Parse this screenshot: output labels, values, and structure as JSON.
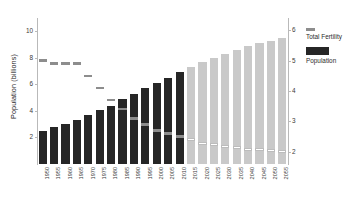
{
  "chart_data": {
    "type": "bar",
    "title": "",
    "xlabel": "",
    "ylabel": "Population (billions)",
    "ylabel_right": "",
    "ylim": [
      0,
      11
    ],
    "ylim_right": [
      1.6,
      6.4
    ],
    "grid": false,
    "legend_position": "right",
    "categories": [
      "1950",
      "1955",
      "1960",
      "1965",
      "1970",
      "1975",
      "1980",
      "1985",
      "1990",
      "1995",
      "2000",
      "2005",
      "2010",
      "2015",
      "2020",
      "2025",
      "2030",
      "2035",
      "2040",
      "2045",
      "2050",
      "2055"
    ],
    "series": [
      {
        "name": "Population",
        "axis": "left",
        "unit": "billions",
        "values": [
          2.5,
          2.8,
          3.0,
          3.3,
          3.7,
          4.1,
          4.4,
          4.9,
          5.3,
          5.7,
          6.1,
          6.5,
          6.9,
          7.3,
          7.7,
          8.0,
          8.3,
          8.6,
          8.9,
          9.1,
          9.3,
          9.5
        ],
        "historical_count": 13,
        "projected_count": 9,
        "color_historical": "#262626",
        "color_projected": "#c9c9c9"
      },
      {
        "name": "Total Fertility",
        "axis": "right",
        "unit": "children per woman",
        "values": [
          5.0,
          4.9,
          4.9,
          4.9,
          4.5,
          4.1,
          3.7,
          3.4,
          3.1,
          2.9,
          2.7,
          2.6,
          2.5,
          2.4,
          2.3,
          2.25,
          2.2,
          2.15,
          2.1,
          2.08,
          2.05,
          2.02
        ],
        "color": "#8d8d8d"
      }
    ],
    "yticks_left": [
      "10",
      "8",
      "6",
      "4",
      "2"
    ],
    "yticks_left_values": [
      10,
      8,
      6,
      4,
      2
    ],
    "yticks_right": [
      "6",
      "5",
      "4",
      "3",
      "2"
    ],
    "yticks_right_values": [
      6,
      5,
      4,
      3,
      2
    ]
  },
  "legend": {
    "fertility_label": "Total Fertility",
    "population_label": "Population"
  },
  "colors": {
    "historical": "#262626",
    "projected": "#c9c9c9",
    "fertility": "#8d8d8d",
    "axis": "#b9b9b9"
  }
}
